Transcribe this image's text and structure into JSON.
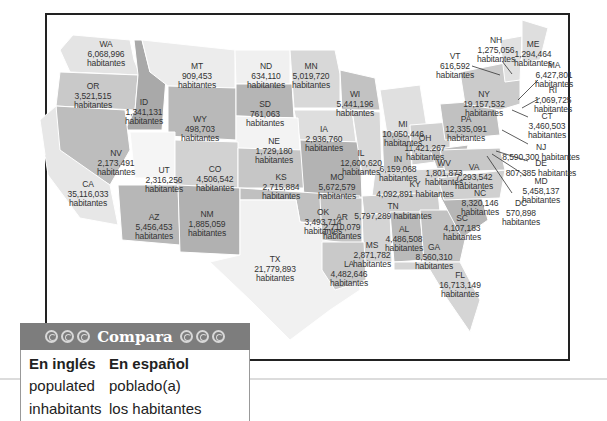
{
  "map": {
    "unit_label": "habitantes",
    "states": [
      {
        "abbr": "WA",
        "population": "6,068,996",
        "x": 106,
        "y": 40
      },
      {
        "abbr": "OR",
        "population": "3,521,515",
        "x": 93,
        "y": 82
      },
      {
        "abbr": "ID",
        "population": "1,341,131",
        "x": 144,
        "y": 98
      },
      {
        "abbr": "MT",
        "population": "909,453",
        "x": 197,
        "y": 62
      },
      {
        "abbr": "WY",
        "population": "498,703",
        "x": 200,
        "y": 115
      },
      {
        "abbr": "ND",
        "population": "634,110",
        "x": 266,
        "y": 62
      },
      {
        "abbr": "SD",
        "population": "761,063",
        "x": 265,
        "y": 100
      },
      {
        "abbr": "MN",
        "population": "5,019,720",
        "x": 311,
        "y": 62
      },
      {
        "abbr": "WI",
        "population": "5,441,196",
        "x": 355,
        "y": 90
      },
      {
        "abbr": "IA",
        "population": "2,936,760",
        "x": 324,
        "y": 125
      },
      {
        "abbr": "NE",
        "population": "1,729,180",
        "x": 274,
        "y": 137
      },
      {
        "abbr": "MI",
        "population": "10,050,446",
        "x": 403,
        "y": 120
      },
      {
        "abbr": "NV",
        "population": "2,173,491",
        "x": 116,
        "y": 149
      },
      {
        "abbr": "UT",
        "population": "2,316,256",
        "x": 164,
        "y": 166
      },
      {
        "abbr": "CO",
        "population": "4,506,542",
        "x": 215,
        "y": 165
      },
      {
        "abbr": "CA",
        "population": "35,116,033",
        "x": 88,
        "y": 180
      },
      {
        "abbr": "KS",
        "population": "2,715,884",
        "x": 281,
        "y": 173
      },
      {
        "abbr": "MO",
        "population": "5,672,579",
        "x": 337,
        "y": 173
      },
      {
        "abbr": "IL",
        "population": "12,600,620",
        "x": 361,
        "y": 149
      },
      {
        "abbr": "IN",
        "population": "6,159,068",
        "x": 398,
        "y": 155
      },
      {
        "abbr": "OH",
        "population": "11,421,267",
        "x": 425,
        "y": 134
      },
      {
        "abbr": "WV",
        "population": "1,801,873",
        "x": 444,
        "y": 159
      },
      {
        "abbr": "KY",
        "population": "4,092,891 habitantes",
        "x": 415,
        "y": 180
      },
      {
        "abbr": "AZ",
        "population": "5,456,453",
        "x": 154,
        "y": 213
      },
      {
        "abbr": "NM",
        "population": "1,885,059",
        "x": 207,
        "y": 210
      },
      {
        "abbr": "OK",
        "population": "3,493,714",
        "x": 323,
        "y": 208
      },
      {
        "abbr": "TX",
        "population": "21,779,893",
        "x": 275,
        "y": 255
      },
      {
        "abbr": "AR",
        "population": "2,710,079",
        "x": 342,
        "y": 213
      },
      {
        "abbr": "TN",
        "population": "5,797,289 habitantes",
        "x": 393,
        "y": 202
      },
      {
        "abbr": "MS",
        "population": "2,871,782",
        "x": 372,
        "y": 241
      },
      {
        "abbr": "AL",
        "population": "4,486,508",
        "x": 404,
        "y": 225
      },
      {
        "abbr": "LA",
        "population": "4,482,646",
        "x": 349,
        "y": 260
      },
      {
        "abbr": "GA",
        "population": "8,560,310",
        "x": 434,
        "y": 243
      },
      {
        "abbr": "SC",
        "population": "4,107,183",
        "x": 462,
        "y": 214
      },
      {
        "abbr": "NC",
        "population": "8,320,146",
        "x": 480,
        "y": 189
      },
      {
        "abbr": "VA",
        "population": "7,293,542",
        "x": 474,
        "y": 163
      },
      {
        "abbr": "FL",
        "population": "16,713,149",
        "x": 460,
        "y": 271
      },
      {
        "abbr": "PA",
        "population": "12,335,091",
        "x": 466,
        "y": 115
      },
      {
        "abbr": "NY",
        "population": "19,157,532",
        "x": 484,
        "y": 90
      },
      {
        "abbr": "VT",
        "population": "616,592",
        "x": 455,
        "y": 52
      },
      {
        "abbr": "NH",
        "population": "1,275,056",
        "x": 496,
        "y": 36
      },
      {
        "abbr": "ME",
        "population": "1,294,464",
        "x": 533,
        "y": 40
      },
      {
        "abbr": "MA",
        "population": "6,427,801",
        "x": 554,
        "y": 61
      },
      {
        "abbr": "RI",
        "population": "1,069,725",
        "x": 553,
        "y": 86
      },
      {
        "abbr": "CT",
        "population": "3,460,503",
        "x": 547,
        "y": 112
      },
      {
        "abbr": "NJ",
        "population": "8,590,300 habitantes",
        "x": 541,
        "y": 143
      },
      {
        "abbr": "DE",
        "population": "807,385 habitantes",
        "x": 541,
        "y": 159
      },
      {
        "abbr": "MD",
        "population": "5,458,137",
        "x": 541,
        "y": 177
      },
      {
        "abbr": "DC",
        "population": "570,898",
        "x": 521,
        "y": 199
      }
    ]
  },
  "compara": {
    "title": "Compara",
    "col1_header": "En inglés",
    "col2_header": "En español",
    "rows": [
      {
        "en": "populated",
        "es": "poblado(a)"
      },
      {
        "en": "inhabitants",
        "es": "los habitantes"
      }
    ]
  }
}
